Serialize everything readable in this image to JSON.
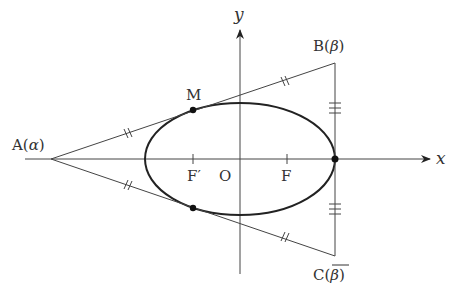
{
  "diagram": {
    "axes": {
      "x_label": "x",
      "y_label": "y",
      "origin_label": "O"
    },
    "points": {
      "A": {
        "label": "A(",
        "sym": "α",
        "close": ")"
      },
      "B": {
        "label": "B(",
        "sym": "β",
        "close": ")"
      },
      "C": {
        "label": "C(",
        "sym": "β",
        "close": ")",
        "conjugate": true
      },
      "M": {
        "label": "M"
      },
      "F": {
        "label": "F"
      },
      "F_prime": {
        "label": "F′"
      }
    },
    "marks": {
      "tangent_segments": "double tick (equal length)",
      "vertical_segments": "triple tick (equal length)"
    },
    "colors": {
      "stroke": "#333333",
      "ellipse": "#222222",
      "background": "#ffffff"
    }
  }
}
